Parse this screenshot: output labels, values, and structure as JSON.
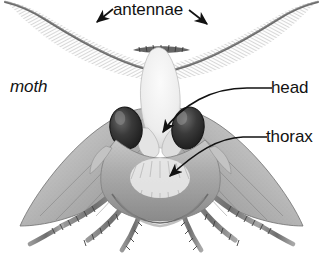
{
  "figure": {
    "title": "moth",
    "caption_style": "italic",
    "background_color": "#ffffff",
    "ink_color": "#121212",
    "width": 323,
    "height": 264
  },
  "labels": {
    "antennae": {
      "text": "antennae",
      "x": 113,
      "y": 1,
      "pointer": "double-arrow",
      "arrow_left_target": "left antenna",
      "arrow_right_target": "right antenna"
    },
    "head": {
      "text": "head",
      "x": 271,
      "y": 79,
      "pointer": "curved-leader-arrow",
      "target": "head / face between the compound eyes"
    },
    "thorax": {
      "text": "thorax",
      "x": 266,
      "y": 128,
      "pointer": "curved-leader-arrow",
      "target": "furry thorax below the head"
    },
    "moth": {
      "text": "moth",
      "x": 10,
      "y": 78,
      "pointer": "none"
    }
  },
  "anatomy": {
    "parts": [
      {
        "name": "left antenna",
        "description": "feathery plumose antenna sweeping up and to the left"
      },
      {
        "name": "right antenna",
        "description": "feathery plumose antenna sweeping up and to the right"
      },
      {
        "name": "left compound eye",
        "description": "large dark oval eye"
      },
      {
        "name": "right compound eye",
        "description": "large dark oval eye"
      },
      {
        "name": "head",
        "description": "pale scaled face between the eyes"
      },
      {
        "name": "thorax",
        "description": "furry body segment behind the head"
      },
      {
        "name": "left forewing",
        "description": "grey triangular wing"
      },
      {
        "name": "right forewing",
        "description": "grey triangular wing"
      },
      {
        "name": "legs",
        "description": "six banded legs spread below the body"
      }
    ]
  },
  "icons": {
    "arrow": "arrow-icon",
    "leader_line": "leader-line-icon"
  }
}
